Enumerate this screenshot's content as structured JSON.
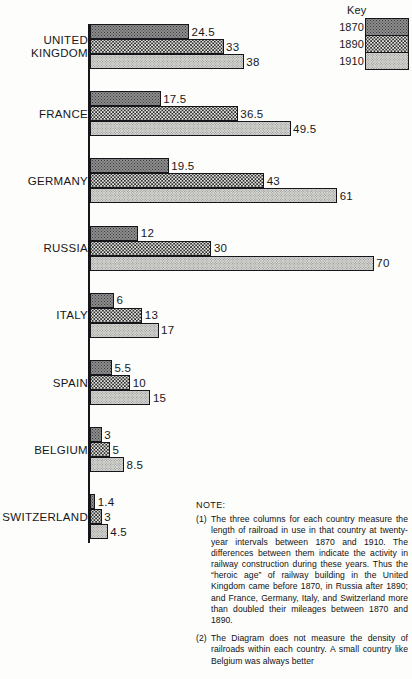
{
  "legend": {
    "title": "Key",
    "entries": [
      {
        "year": "1870",
        "pattern": "dark-dense-dots"
      },
      {
        "year": "1890",
        "pattern": "medium-checker-dots"
      },
      {
        "year": "1910",
        "pattern": "light-fine-dots"
      }
    ]
  },
  "note": {
    "heading": "NOTE:",
    "items": [
      {
        "num": "(1)",
        "text": "The three columns for each country measure the length of railroad in use in that country at twenty-year intervals between 1870 and 1910. The differences between them indicate the activity in railway construction during these years. Thus the “heroic age” of railway building in the United Kingdom came before 1870, in Russia after 1890; and France, Germany, Italy, and Switzerland more than doubled their mileages between 1870 and 1890."
      },
      {
        "num": "(2)",
        "text": "The Diagram does not measure the density of railroads within each country. A small country like Belgium was always better"
      }
    ]
  },
  "chart_data": {
    "type": "bar",
    "orientation": "horizontal",
    "title": "",
    "xlabel": "",
    "ylabel": "",
    "categories": [
      "UNITED\nKINGDOM",
      "FRANCE",
      "GERMANY",
      "RUSSIA",
      "ITALY",
      "SPAIN",
      "BELGIUM",
      "SWITZERLAND"
    ],
    "series": [
      {
        "name": "1870",
        "values": [
          24.5,
          17.5,
          19.5,
          12,
          6,
          5.5,
          3,
          1.4
        ]
      },
      {
        "name": "1890",
        "values": [
          33,
          36.5,
          43,
          30,
          13,
          10,
          5,
          3
        ]
      },
      {
        "name": "1910",
        "values": [
          38,
          49.5,
          61,
          70,
          17,
          15,
          8.5,
          4.5
        ]
      }
    ],
    "value_labels": [
      [
        "24.5",
        "33",
        "38"
      ],
      [
        "17.5",
        "36.5",
        "49.5"
      ],
      [
        "19.5",
        "43",
        "61"
      ],
      [
        "12",
        "30",
        "70"
      ],
      [
        "6",
        "13",
        "17"
      ],
      [
        "5.5",
        "10",
        "15"
      ],
      [
        "3",
        "5",
        "8.5"
      ],
      [
        "1.4",
        "3",
        "4.5"
      ]
    ],
    "xlim": [
      0,
      70
    ],
    "grid": false,
    "legend_position": "top-right"
  }
}
